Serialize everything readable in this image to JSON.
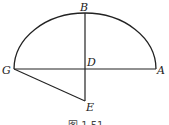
{
  "diagram": {
    "points": {
      "A": "A",
      "B": "B",
      "D": "D",
      "E": "E",
      "G": "G"
    },
    "caption": "图 1.51",
    "stroke_color": "#222222"
  }
}
